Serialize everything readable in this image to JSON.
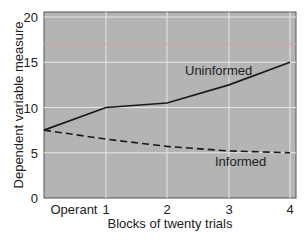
{
  "chart_data": {
    "type": "line",
    "title": "",
    "xlabel": "Blocks of twenty trials",
    "ylabel": "Dependent variable measure",
    "categories": [
      "Operant",
      "1",
      "2",
      "3",
      "4"
    ],
    "x": [
      0,
      1,
      2,
      3,
      4
    ],
    "ylim": [
      0,
      20
    ],
    "yticks": [
      0,
      5,
      10,
      15,
      20
    ],
    "grid": true,
    "legend_position": "inline labels",
    "series": [
      {
        "name": "Uninformed",
        "style": "solid",
        "values": [
          7.5,
          10,
          10.5,
          12.5,
          15
        ]
      },
      {
        "name": "Informed",
        "style": "dashed",
        "values": [
          7.5,
          6.5,
          5.7,
          5.2,
          5.0
        ]
      }
    ],
    "reference_line": {
      "y": 17,
      "color": "#d9a0a0"
    },
    "colors": {
      "plot_background": "#b4b4b4",
      "grid": "#e6e6e6",
      "line": "#1a1a1a"
    }
  }
}
